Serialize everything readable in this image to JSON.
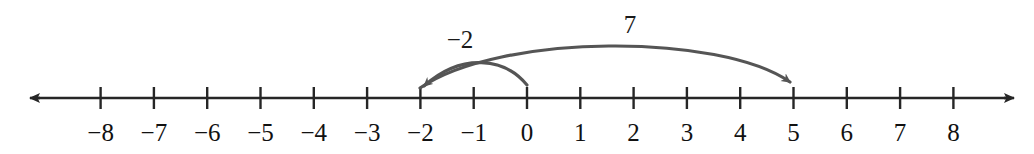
{
  "figure": {
    "kind": "number-line-diagram",
    "background_color": "#ffffff",
    "axis_color": "#262626",
    "arc_color": "#555555",
    "label_color": "#111111"
  },
  "chart_data": {
    "type": "line",
    "title": "",
    "subtitle": "",
    "xlabel": "",
    "ylabel": "",
    "grid": false,
    "legend_position": "none",
    "axis": {
      "orientation": "horizontal",
      "min": -9,
      "max": 9,
      "tick_min": -8,
      "tick_max": 8,
      "tick_step": 1,
      "left_arrow": true,
      "right_arrow": true,
      "pixel_per_unit": 53.3,
      "origin_px": 527,
      "axis_y_px": 98
    },
    "categories": [
      "-8",
      "-7",
      "-6",
      "-5",
      "-4",
      "-3",
      "-2",
      "-1",
      "0",
      "1",
      "2",
      "3",
      "4",
      "5",
      "6",
      "7",
      "8"
    ],
    "values": [
      -8,
      -7,
      -6,
      -5,
      -4,
      -3,
      -2,
      -1,
      0,
      1,
      2,
      3,
      4,
      5,
      6,
      7,
      8
    ],
    "tick_labels": [
      "−8",
      "−7",
      "−6",
      "−5",
      "−4",
      "−3",
      "−2",
      "−1",
      "0",
      "1",
      "2",
      "3",
      "4",
      "5",
      "6",
      "7",
      "8"
    ],
    "annotations": [
      {
        "name": "jump-minus-two",
        "label": "−2",
        "value": -2,
        "start": 0,
        "end": -2,
        "direction": "left",
        "label_x_px": 460,
        "label_y_px": 48,
        "arc_peak_y_px": 58
      },
      {
        "name": "jump-seven",
        "label": "7",
        "value": 7,
        "start": -2,
        "end": 5,
        "direction": "right",
        "label_x_px": 630,
        "label_y_px": 33,
        "arc_peak_y_px": 42
      }
    ]
  }
}
